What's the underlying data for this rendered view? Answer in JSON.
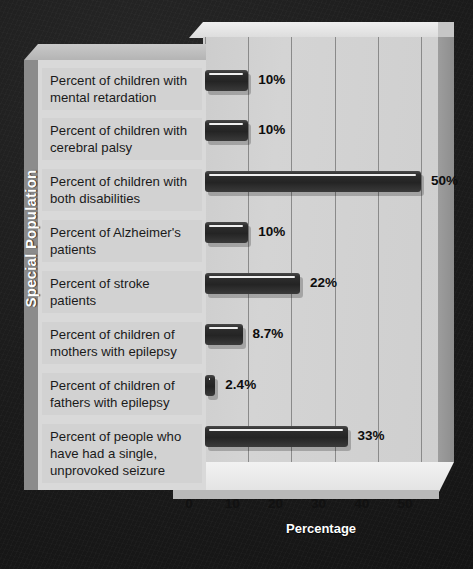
{
  "chart_data": {
    "type": "bar",
    "orientation": "horizontal",
    "title": "",
    "xlabel": "Percentage",
    "ylabel": "Special Population",
    "xlim": [
      0,
      55
    ],
    "xticks": [
      0,
      10,
      20,
      30,
      40,
      50
    ],
    "xtick_labels": [
      "0",
      "10",
      "20",
      "30",
      "40",
      "50"
    ],
    "grid": true,
    "legend": false,
    "style": "3d-isometric",
    "categories": [
      "Percent of children with mental retardation",
      "Percent of children with cerebral palsy",
      "Percent of children with both disabilities",
      "Percent of Alzheimer's patients",
      "Percent of stroke patients",
      "Percent of children of mothers with epilepsy",
      "Percent of children of fathers with epilepsy",
      "Percent of people who have had a single, unprovoked seizure"
    ],
    "values": [
      10,
      10,
      50,
      10,
      22,
      8.7,
      2.4,
      33
    ],
    "value_labels": [
      "10%",
      "10%",
      "50%",
      "10%",
      "22%",
      "8.7%",
      "2.4%",
      "33%"
    ],
    "bars": [
      {
        "label_lines": [
          "Percent of children with",
          "mental retardation"
        ],
        "value": 10,
        "value_label": "10%"
      },
      {
        "label_lines": [
          "Percent of children with",
          "cerebral palsy"
        ],
        "value": 10,
        "value_label": "10%"
      },
      {
        "label_lines": [
          "Percent of children with",
          "both disabilities"
        ],
        "value": 50,
        "value_label": "50%"
      },
      {
        "label_lines": [
          "Percent of Alzheimer's",
          "patients"
        ],
        "value": 10,
        "value_label": "10%"
      },
      {
        "label_lines": [
          "Percent of stroke",
          "patients"
        ],
        "value": 22,
        "value_label": "22%"
      },
      {
        "label_lines": [
          "Percent of children of",
          "mothers with epilepsy"
        ],
        "value": 8.7,
        "value_label": "8.7%"
      },
      {
        "label_lines": [
          "Percent of children of",
          "fathers with epilepsy"
        ],
        "value": 2.4,
        "value_label": "2.4%"
      },
      {
        "label_lines": [
          "Percent of people who",
          "have had a single,",
          "unprovoked seizure"
        ],
        "value": 33,
        "value_label": "33%"
      }
    ],
    "colors": {
      "background": "#1c1c1c",
      "bar": "#2b2b2b",
      "plot_area": "#d0d0d0",
      "label_panel": "#d2d2d2",
      "gridline": "#8a8a8a",
      "axis_text": "#111111",
      "axis_title_text": "#ffffff"
    }
  },
  "axis": {
    "x_title": "Percentage",
    "y_title": "Special Population",
    "ticks": [
      "0",
      "10",
      "20",
      "30",
      "40",
      "50"
    ]
  }
}
